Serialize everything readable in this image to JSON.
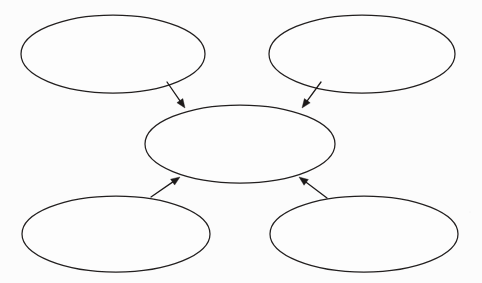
{
  "page": {
    "background_color": "#fcfcfc",
    "ink_color": "#1d1a1a",
    "width": 482,
    "height": 283
  },
  "diagram": {
    "type": "concept-map",
    "layout": "four-source-one-center",
    "node_shape": "ellipse",
    "node_fill": "#fdfdfd",
    "node_stroke": "#221f1f",
    "nodes": [
      {
        "id": "top-left",
        "name": "node-top-left",
        "label": "",
        "cx": 113,
        "cy": 54,
        "rx": 92,
        "ry": 39
      },
      {
        "id": "top-right",
        "name": "node-top-right",
        "label": "",
        "cx": 362,
        "cy": 54,
        "rx": 93,
        "ry": 39
      },
      {
        "id": "center",
        "name": "node-center",
        "label": "",
        "cx": 240,
        "cy": 144,
        "rx": 95,
        "ry": 39
      },
      {
        "id": "bottom-left",
        "name": "node-bottom-left",
        "label": "",
        "cx": 116,
        "cy": 234,
        "rx": 94,
        "ry": 38
      },
      {
        "id": "bottom-right",
        "name": "node-bottom-right",
        "label": "",
        "cx": 364,
        "cy": 234,
        "rx": 94,
        "ry": 38
      }
    ],
    "connectors": [
      {
        "id": "arrow-top-left-to-center",
        "name": "arrow-top-left-to-center",
        "from": "top-left",
        "to": "center",
        "x1": 167,
        "y1": 82,
        "x2": 185,
        "y2": 108,
        "direction": "down-right"
      },
      {
        "id": "arrow-top-right-to-center",
        "name": "arrow-top-right-to-center",
        "from": "top-right",
        "to": "center",
        "x1": 321,
        "y1": 82,
        "x2": 302,
        "y2": 108,
        "direction": "down-left"
      },
      {
        "id": "arrow-bottom-left-to-center",
        "name": "arrow-bottom-left-to-center",
        "from": "bottom-left",
        "to": "center",
        "x1": 151,
        "y1": 197,
        "x2": 180,
        "y2": 177,
        "direction": "up-right"
      },
      {
        "id": "arrow-bottom-right-to-center",
        "name": "arrow-bottom-right-to-center",
        "from": "bottom-right",
        "to": "center",
        "x1": 327,
        "y1": 198,
        "x2": 299,
        "y2": 177,
        "direction": "up-left"
      }
    ]
  }
}
